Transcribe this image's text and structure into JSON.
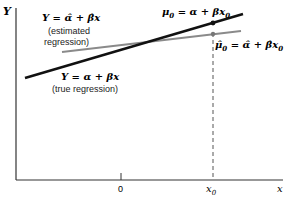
{
  "diagram": {
    "axes": {
      "y_label": "Y",
      "x_label": "x",
      "origin_tick": "0",
      "x0_tick": "x",
      "x0_sub": "0"
    },
    "true_line": {
      "equation": "Y = α + βx",
      "caption": "(true regression)",
      "color": "#111111"
    },
    "estimated_line": {
      "equation": "Y = α̂ + β̂x",
      "caption1": "(estimated",
      "caption2": "regression)",
      "color": "#8a8a8a"
    },
    "mu0": {
      "label_main": "μ",
      "label_sub": "0",
      "label_rest": " = α + βx",
      "label_rest_sub": "0"
    },
    "mu0_hat": {
      "label_main": "μ̂",
      "label_sub": "0",
      "label_rest": " = α̂ + β̂x",
      "label_rest_sub": "0"
    }
  }
}
